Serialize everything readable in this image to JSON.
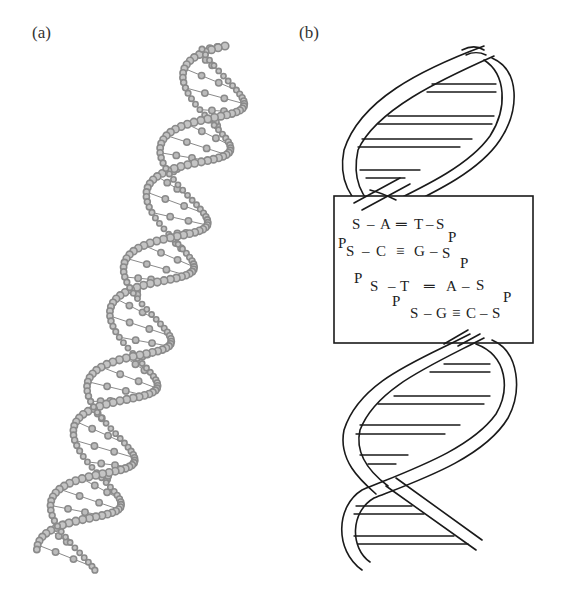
{
  "figure": {
    "panels": [
      {
        "id": "a",
        "label": "(a)",
        "description": "Ball-and-stick model of DNA double helix"
      },
      {
        "id": "b",
        "label": "(b)",
        "description": "Schematic DNA double helix with base-pair chemistry inset"
      }
    ],
    "inset": {
      "rows": [
        {
          "left": "S",
          "base1": "A",
          "bond": "=",
          "base2": "T",
          "right": "S"
        },
        {
          "left": "S",
          "base1": "C",
          "bond": "≡",
          "base2": "G",
          "right": "S"
        },
        {
          "left": "S",
          "base1": "T",
          "bond": "=",
          "base2": "A",
          "right": "S"
        },
        {
          "left": "S",
          "base1": "G",
          "bond": "≡",
          "base2": "C",
          "right": "S"
        }
      ],
      "phosphate": "P",
      "sugar": "S"
    },
    "colors": {
      "ball_model": "#8a8a8a",
      "line_drawing": "#1a1a1a",
      "background": "#ffffff"
    }
  }
}
